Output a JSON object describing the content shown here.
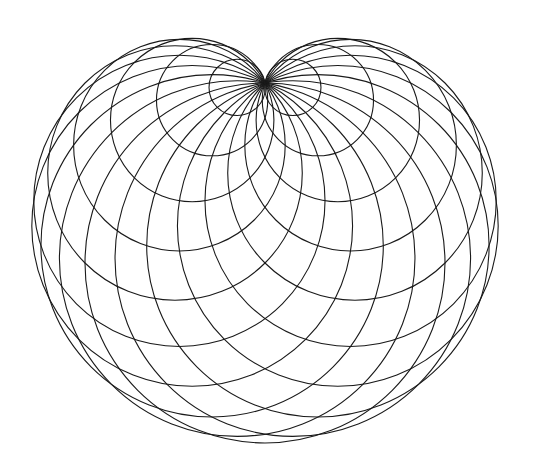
{
  "figure": {
    "type": "cardioid-circle-envelope",
    "background": "#ffffff",
    "stroke_color": "#1a1a1a",
    "stroke_width": 1.1,
    "cusp": {
      "x": 265,
      "y": 83
    },
    "base_circle": {
      "cx": 265,
      "cy": 173,
      "r": 90
    },
    "circle_count": 20,
    "angle_step_deg": 18
  }
}
